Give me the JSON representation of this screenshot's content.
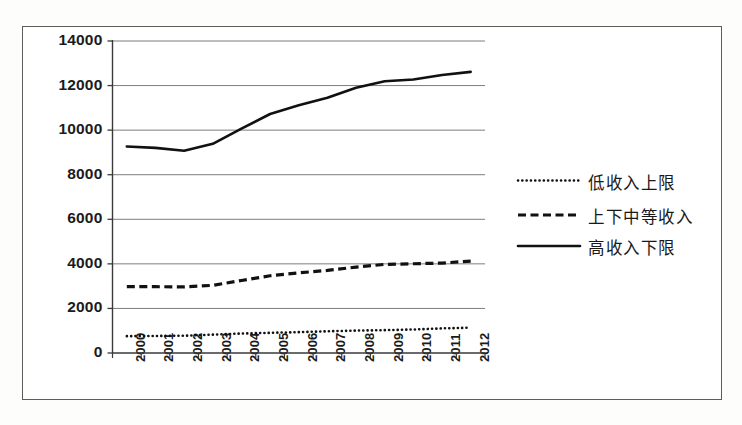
{
  "chart_data": {
    "type": "line",
    "title": "",
    "subtitle": "",
    "xlabel": "",
    "ylabel": "",
    "categories": [
      "2000",
      "2001",
      "2002",
      "2003",
      "2004",
      "2005",
      "2006",
      "2007",
      "2008",
      "2009",
      "2010",
      "2011",
      "2012"
    ],
    "ylim": [
      0,
      14000
    ],
    "ytick_values": [
      0,
      2000,
      4000,
      6000,
      8000,
      10000,
      12000,
      14000
    ],
    "ytick_labels": [
      "0",
      "2000",
      "4000",
      "6000",
      "8000",
      "10000",
      "12000",
      "14000"
    ],
    "grid": "horizontal",
    "legend_position": "right",
    "series": [
      {
        "name": "低收入上限",
        "style": "dotted",
        "color": "#111111",
        "values": [
          755,
          765,
          775,
          825,
          875,
          905,
          935,
          975,
          1005,
          1025,
          1055,
          1105,
          1135
        ]
      },
      {
        "name": "上下中等收入",
        "style": "dashed",
        "color": "#111111",
        "values": [
          2975,
          2975,
          2965,
          3035,
          3255,
          3465,
          3595,
          3705,
          3855,
          3975,
          4005,
          4035,
          4125
        ]
      },
      {
        "name": "高收入下限",
        "style": "solid",
        "color": "#111111",
        "values": [
          9265,
          9205,
          9075,
          9385,
          10065,
          10725,
          11115,
          11455,
          11905,
          12195,
          12275,
          12475,
          12615
        ]
      }
    ]
  },
  "legend": {
    "items": [
      {
        "label": "低收入上限",
        "style": "dotted"
      },
      {
        "label": "上下中等收入",
        "style": "dashed"
      },
      {
        "label": "高收入下限",
        "style": "solid"
      }
    ]
  }
}
